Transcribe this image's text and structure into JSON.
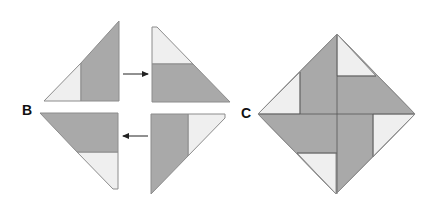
{
  "labels": {
    "b": "B",
    "c": "C"
  },
  "colors": {
    "light": "#efefef",
    "dark": "#a9a9a9",
    "stroke": "#8c8c8c",
    "line": "#555555",
    "arrow": "#222222"
  },
  "figure_b": {
    "pieces": [
      {
        "name": "top-left-piece",
        "light": "44,101 81,63 81,101 44,101",
        "dark": "81,63 119,21 119,101 81,101"
      },
      {
        "name": "top-right-piece",
        "light": "152,27 157,27 193,64 152,64",
        "dark": "152,64 193,64 230,102 152,102"
      },
      {
        "name": "bottom-left-piece",
        "dark": "40,113 118,113 118,152 77,152",
        "light": "77,152 118,152 118,189 113,189"
      },
      {
        "name": "bottom-right-piece",
        "dark": "151,114 188,114 188,156 151,194",
        "light": "188,114 225,114 225,118 188,156"
      }
    ],
    "arrows": [
      {
        "name": "arrow-right",
        "x1": 123,
        "y1": 74,
        "x2": 148,
        "y2": 74
      },
      {
        "name": "arrow-left",
        "x1": 148,
        "y1": 136,
        "x2": 123,
        "y2": 136
      }
    ]
  },
  "figure_c": {
    "outline": "337,34 415,114 336,194 258,114",
    "light": [
      "258,114 300,72 300,114",
      "337,34 376,76 337,76",
      "415,114 373,157 373,114",
      "336,194 297,153 336,153"
    ],
    "lines": [
      "300,72 300,114",
      "337,34 337,194",
      "258,114 415,114",
      "337,76 376,76",
      "373,114 373,157",
      "297,153 337,153"
    ]
  }
}
